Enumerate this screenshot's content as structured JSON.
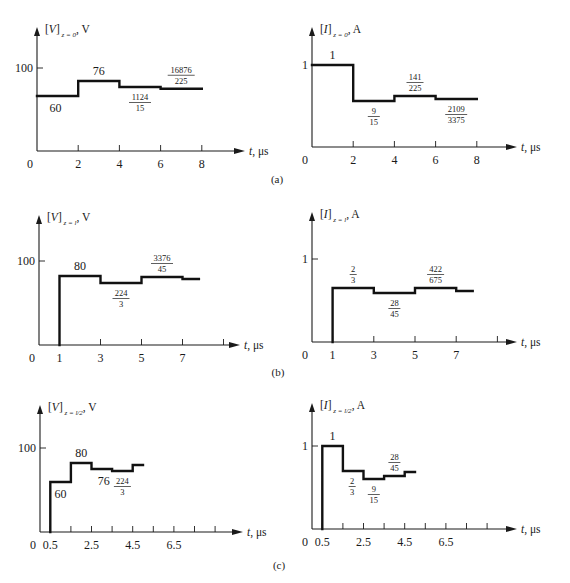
{
  "figure": {
    "captions": [
      {
        "id": "a",
        "text": "(a)",
        "x": 277,
        "y": 183
      },
      {
        "id": "b",
        "text": "(b)",
        "x": 278,
        "y": 376
      },
      {
        "id": "c",
        "text": "(c)",
        "x": 279,
        "y": 569
      }
    ]
  },
  "chart_data": [
    {
      "id": "a-voltage",
      "type": "line",
      "step": true,
      "title_main": "[V]",
      "title_sub": "z = 0",
      "title_unit": ", V",
      "xlabel": "t, μs",
      "ylabel_tick": "100",
      "origin_label": "0",
      "x_ticks": [
        2,
        4,
        6,
        8
      ],
      "x_tick_labels": [
        "2",
        "4",
        "6",
        "8"
      ],
      "ylim": [
        0,
        100
      ],
      "points": [
        [
          0,
          60
        ],
        [
          2,
          60
        ],
        [
          2,
          76
        ],
        [
          4,
          76
        ],
        [
          4,
          74.93
        ],
        [
          6,
          74.93
        ],
        [
          6,
          75.0
        ],
        [
          8,
          75.0
        ]
      ],
      "segment_labels": [
        {
          "kind": "int",
          "text": "60",
          "t": 0.9,
          "side": "below"
        },
        {
          "kind": "int",
          "text": "76",
          "t": 3.0,
          "side": "above"
        },
        {
          "kind": "frac",
          "num": "1124",
          "den": "15",
          "t": 5.0,
          "side": "below"
        },
        {
          "kind": "frac",
          "num": "16876",
          "den": "225",
          "t": 7.0,
          "side": "above"
        }
      ],
      "layout": {
        "ox": 37,
        "oy": 151,
        "ytop": 27,
        "xend": 245,
        "x_unit": 20.6,
        "y_ref_px": 68,
        "label_x": 249,
        "levels_px": {
          "60": 96,
          "76": 81,
          "74.93": 87,
          "75.0": 82
        }
      }
    },
    {
      "id": "a-current",
      "type": "line",
      "step": true,
      "title_main": "[I]",
      "title_sub": "z = 0",
      "title_unit": ", A",
      "xlabel": "t, μs",
      "ylabel_tick": "1",
      "origin_label": "0",
      "x_ticks": [
        2,
        4,
        6,
        8
      ],
      "x_tick_labels": [
        "2",
        "4",
        "6",
        "8"
      ],
      "ylim": [
        0,
        1
      ],
      "points": [
        [
          0,
          1
        ],
        [
          2,
          1
        ],
        [
          2,
          0.6
        ],
        [
          4,
          0.6
        ],
        [
          4,
          0.6267
        ],
        [
          6,
          0.6267
        ],
        [
          6,
          0.6249
        ],
        [
          8,
          0.6249
        ]
      ],
      "segment_labels": [
        {
          "kind": "int",
          "text": "1",
          "t": 1.0,
          "side": "above"
        },
        {
          "kind": "frac",
          "num": "9",
          "den": "15",
          "t": 3.0,
          "side": "below"
        },
        {
          "kind": "frac",
          "num": "141",
          "den": "225",
          "t": 5.0,
          "side": "above"
        },
        {
          "kind": "frac",
          "num": "2109",
          "den": "3375",
          "t": 7.0,
          "side": "below"
        }
      ],
      "layout": {
        "ox": 312,
        "oy": 147,
        "ytop": 27,
        "xend": 517,
        "x_unit": 20.6,
        "y_ref_px": 65,
        "label_x": 521,
        "levels_px": {
          "1": 65,
          "0.6": 101,
          "0.6267": 96,
          "0.6249": 99
        }
      }
    },
    {
      "id": "b-voltage",
      "type": "line",
      "step": true,
      "title_main": "[V]",
      "title_sub": "z = l",
      "title_unit": ", V",
      "xlabel": "t, μs",
      "ylabel_tick": "100",
      "origin_label": "0",
      "x_ticks": [
        1,
        3,
        5,
        7,
        9
      ],
      "x_tick_labels": [
        "1",
        "3",
        "5",
        "7",
        ""
      ],
      "ylim": [
        0,
        100
      ],
      "points": [
        [
          1,
          0
        ],
        [
          1,
          80
        ],
        [
          3,
          80
        ],
        [
          3,
          74.67
        ],
        [
          5,
          74.67
        ],
        [
          5,
          75.02
        ],
        [
          7,
          75.02
        ],
        [
          7,
          74.8
        ],
        [
          7.8,
          74.8
        ]
      ],
      "segment_labels": [
        {
          "kind": "int",
          "text": "80",
          "t": 2.0,
          "side": "above"
        },
        {
          "kind": "frac",
          "num": "224",
          "den": "3",
          "t": 4.0,
          "side": "below"
        },
        {
          "kind": "frac",
          "num": "3376",
          "den": "45",
          "t": 6.0,
          "side": "above"
        }
      ],
      "layout": {
        "ox": 39,
        "oy": 345,
        "ytop": 215,
        "xend": 240,
        "x_unit": 20.5,
        "x_origin_t": 0,
        "y_ref_px": 261,
        "label_x": 244,
        "levels_px": {
          "0": 345,
          "80": 276,
          "74.67": 283,
          "75.02": 277,
          "74.8": 279
        }
      }
    },
    {
      "id": "b-current",
      "type": "line",
      "step": true,
      "title_main": "[I]",
      "title_sub": "z = l",
      "title_unit": ", A",
      "xlabel": "t, μs",
      "ylabel_tick": "1",
      "origin_label": "0",
      "x_ticks": [
        1,
        3,
        5,
        7,
        9
      ],
      "x_tick_labels": [
        "1",
        "3",
        "5",
        "7",
        ""
      ],
      "ylim": [
        0,
        1
      ],
      "points": [
        [
          1,
          0
        ],
        [
          1,
          0.6667
        ],
        [
          3,
          0.6667
        ],
        [
          3,
          0.6222
        ],
        [
          5,
          0.6222
        ],
        [
          5,
          0.6252
        ],
        [
          7,
          0.6252
        ],
        [
          7,
          0.624
        ],
        [
          7.8,
          0.624
        ]
      ],
      "segment_labels": [
        {
          "kind": "frac",
          "num": "2",
          "den": "3",
          "t": 2.0,
          "side": "above"
        },
        {
          "kind": "frac",
          "num": "28",
          "den": "45",
          "t": 4.0,
          "side": "below"
        },
        {
          "kind": "frac",
          "num": "422",
          "den": "675",
          "t": 6.0,
          "side": "above"
        }
      ],
      "layout": {
        "ox": 312,
        "oy": 342,
        "ytop": 212,
        "xend": 517,
        "x_unit": 20.6,
        "y_ref_px": 259,
        "label_x": 521,
        "levels_px": {
          "0": 342,
          "0.6667": 288,
          "0.6222": 293,
          "0.6252": 288,
          "0.624": 291
        }
      }
    },
    {
      "id": "c-voltage",
      "type": "line",
      "step": true,
      "title_main": "[V]",
      "title_sub": "z = l/2",
      "title_unit": ", V",
      "xlabel": "t, μs",
      "ylabel_tick": "100",
      "origin_label": "0",
      "x_ticks": [
        0.5,
        1.5,
        2.5,
        3.5,
        4.5,
        5.5,
        6.5,
        7.5,
        8.5
      ],
      "x_tick_labels": [
        "0.5",
        "",
        "2.5",
        "",
        "4.5",
        "",
        "6.5",
        "",
        ""
      ],
      "ylim": [
        0,
        100
      ],
      "points": [
        [
          0.5,
          0
        ],
        [
          0.5,
          60
        ],
        [
          1.5,
          60
        ],
        [
          1.5,
          80
        ],
        [
          2.5,
          80
        ],
        [
          2.5,
          76
        ],
        [
          3.5,
          76
        ],
        [
          3.5,
          74.67
        ],
        [
          4.5,
          74.67
        ],
        [
          4.5,
          75.02
        ],
        [
          5.0,
          75.02
        ]
      ],
      "segment_labels": [
        {
          "kind": "int",
          "text": "60",
          "t": 1.0,
          "side": "below"
        },
        {
          "kind": "int",
          "text": "80",
          "t": 2.0,
          "side": "above"
        },
        {
          "kind": "int",
          "text": "76",
          "t": 3.1,
          "side": "below"
        },
        {
          "kind": "frac",
          "num": "224",
          "den": "3",
          "t": 4.0,
          "side": "below"
        }
      ],
      "layout": {
        "ox": 40,
        "oy": 532,
        "ytop": 405,
        "xend": 243,
        "x_unit": 20.6,
        "y_ref_px": 448,
        "label_x": 247,
        "levels_px": {
          "0": 532,
          "60": 482,
          "80": 463,
          "76": 469,
          "74.67": 471,
          "75.02": 465
        }
      }
    },
    {
      "id": "c-current",
      "type": "line",
      "step": true,
      "title_main": "[I]",
      "title_sub": "z = l/2",
      "title_unit": ", A",
      "xlabel": "t, μs",
      "ylabel_tick": "1",
      "origin_label": "0",
      "x_ticks": [
        0.5,
        1.5,
        2.5,
        3.5,
        4.5,
        5.5,
        6.5,
        7.5,
        8.5
      ],
      "x_tick_labels": [
        "0.5",
        "",
        "2.5",
        "",
        "4.5",
        "",
        "6.5",
        "",
        ""
      ],
      "ylim": [
        0,
        1
      ],
      "points": [
        [
          0.5,
          0
        ],
        [
          0.5,
          1
        ],
        [
          1.5,
          1
        ],
        [
          1.5,
          0.6667
        ],
        [
          2.5,
          0.6667
        ],
        [
          2.5,
          0.6
        ],
        [
          3.5,
          0.6
        ],
        [
          3.5,
          0.6222
        ],
        [
          4.5,
          0.6222
        ],
        [
          4.5,
          0.64
        ],
        [
          5.0,
          0.64
        ]
      ],
      "segment_labels": [
        {
          "kind": "int",
          "text": "1",
          "t": 1.0,
          "side": "above"
        },
        {
          "kind": "frac",
          "num": "2",
          "den": "3",
          "t": 1.95,
          "side": "below"
        },
        {
          "kind": "frac",
          "num": "9",
          "den": "15",
          "t": 3.0,
          "side": "below"
        },
        {
          "kind": "frac",
          "num": "28",
          "den": "45",
          "t": 4.0,
          "side": "above"
        }
      ],
      "layout": {
        "ox": 312,
        "oy": 529,
        "ytop": 403,
        "xend": 517,
        "x_unit": 20.6,
        "y_ref_px": 446,
        "label_x": 521,
        "levels_px": {
          "0": 529,
          "1": 446,
          "0.6667": 471,
          "0.6": 479,
          "0.6222": 476,
          "0.64": 472
        }
      }
    }
  ]
}
